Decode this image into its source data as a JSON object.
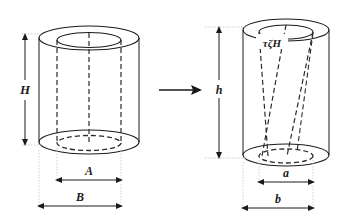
{
  "figure": {
    "background_color": "#ffffff",
    "stroke_color": "#1a1a1a",
    "dash_color": "#2a2a2a",
    "guide_color": "#b8b8b8"
  },
  "left_shape": {
    "name": "undeformed-annular-cylinder",
    "height_label": "H",
    "inner_diameter_label": "A",
    "outer_diameter_label": "B"
  },
  "transform_arrow": {
    "name": "transformation-arrow",
    "glyph": "arrow-right"
  },
  "right_shape": {
    "name": "deformed-annular-cylinder",
    "height_label": "h",
    "inner_diameter_label": "a",
    "outer_diameter_label": "b",
    "twist_label": "τζH"
  }
}
